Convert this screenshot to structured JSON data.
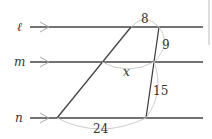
{
  "diagram": {
    "lines": [
      {
        "name": "ℓ",
        "y": 27
      },
      {
        "name": "m",
        "y": 62
      },
      {
        "name": "n",
        "y": 118
      }
    ],
    "segments": {
      "top": "8",
      "upper_right": "9",
      "middle": "x",
      "lower_right": "15",
      "bottom": "24"
    },
    "colors": {
      "line": "#444444",
      "arc": "#cccccc",
      "arrow": "#aaaaaa"
    }
  }
}
